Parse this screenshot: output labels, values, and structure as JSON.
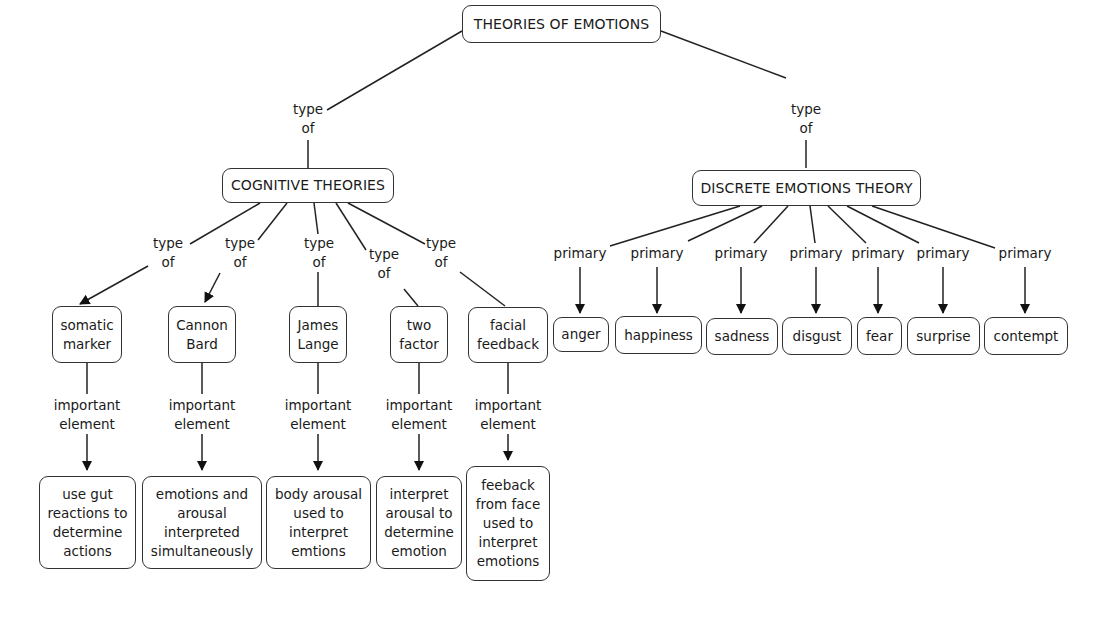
{
  "root": {
    "label": "THEORIES OF EMOTIONS"
  },
  "branches": {
    "cognitive": {
      "label": "COGNITIVE THEORIES",
      "link_label": "type\nof"
    },
    "discrete": {
      "label": "DISCRETE EMOTIONS THEORY",
      "link_label": "type\nof"
    }
  },
  "cognitive_theories": [
    {
      "label": "somatic\nmarker",
      "link_label": "type\nof",
      "element_link_label": "important\nelement",
      "element": "use gut\nreactions to\ndetermine\nactions"
    },
    {
      "label": "Cannon\nBard",
      "link_label": "type\nof",
      "element_link_label": "important\nelement",
      "element": "emotions and\narousal\ninterpreted\nsimultaneously"
    },
    {
      "label": "James\nLange",
      "link_label": "type\nof",
      "element_link_label": "important\nelement",
      "element": "body arousal\nused to\ninterpret\nemtions"
    },
    {
      "label": "two\nfactor",
      "link_label": "type\nof",
      "element_link_label": "important\nelement",
      "element": "interpret\narousal to\ndetermine\nemotion"
    },
    {
      "label": "facial\nfeedback",
      "link_label": "type\nof",
      "element_link_label": "important\nelement",
      "element": "feeback\nfrom face\nused to\ninterpret\nemotions"
    }
  ],
  "primary_emotions": [
    {
      "label": "anger",
      "link_label": "primary"
    },
    {
      "label": "happiness",
      "link_label": "primary"
    },
    {
      "label": "sadness",
      "link_label": "primary"
    },
    {
      "label": "disgust",
      "link_label": "primary"
    },
    {
      "label": "fear",
      "link_label": "primary"
    },
    {
      "label": "surprise",
      "link_label": "primary"
    },
    {
      "label": "contempt",
      "link_label": "primary"
    }
  ]
}
